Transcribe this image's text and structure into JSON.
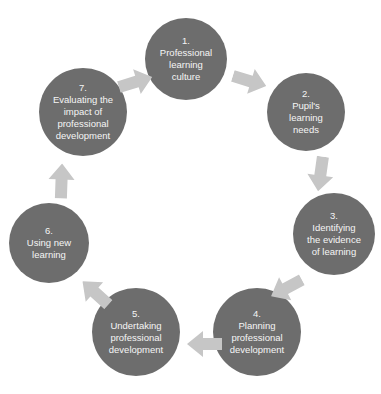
{
  "colors": {
    "circle_fill": "#6d6d6d",
    "arrow_fill": "#c6c6c6",
    "label_text": "#f5f5f5",
    "background": "#ffffff"
  },
  "cycle": {
    "steps": [
      {
        "number": "1.",
        "label": "Professional learning culture"
      },
      {
        "number": "2.",
        "label": "Pupil's learning needs"
      },
      {
        "number": "3.",
        "label": "Identifying the evidence of learning"
      },
      {
        "number": "4.",
        "label": "Planning professional development"
      },
      {
        "number": "5.",
        "label": "Undertaking professional development"
      },
      {
        "number": "6.",
        "label": "Using new learning"
      },
      {
        "number": "7.",
        "label": "Evaluating the impact of professional development"
      }
    ]
  }
}
